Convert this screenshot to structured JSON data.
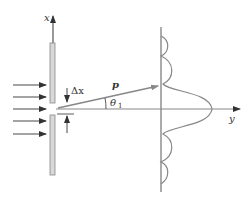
{
  "figure": {
    "type": "single-slit diffraction diagram",
    "labels": {
      "x_axis": "x",
      "y_axis": "y",
      "momentum": "p",
      "slit_width": "Δx",
      "angle": "θ",
      "angle_subscript": "1"
    },
    "incident_arrows_count": 5,
    "colors": {
      "line": "#888888",
      "arrow": "#333333",
      "slit_fill": "#d8d8d8",
      "slit_stroke": "#888888",
      "text": "#333333"
    }
  }
}
